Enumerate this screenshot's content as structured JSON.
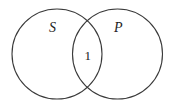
{
  "diagram": {
    "type": "venn",
    "stroke_color": "#3a3a3a",
    "background": "#ffffff",
    "sets": [
      {
        "id": "S",
        "label": "S",
        "cx": 57,
        "cy": 54,
        "r": 45
      },
      {
        "id": "P",
        "label": "P",
        "cx": 117.5,
        "cy": 54,
        "r": 45
      }
    ],
    "regions": [
      {
        "sets": [
          "S",
          "P"
        ],
        "label": "1"
      }
    ]
  }
}
